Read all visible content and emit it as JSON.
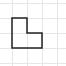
{
  "diagram": {
    "type": "grid-polyomino",
    "grid": {
      "cell_size": 15,
      "vertical_lines_x": [
        12,
        27,
        42,
        57
      ],
      "horizontal_lines_y": [
        3,
        18,
        33,
        48,
        63
      ],
      "line_color": "#e6e6e6"
    },
    "shape": {
      "name": "L-shape",
      "points": "12,18 27,18 27,33 42,33 42,48 12,48",
      "stroke_color": "#222222",
      "stroke_width": 1.5
    }
  }
}
